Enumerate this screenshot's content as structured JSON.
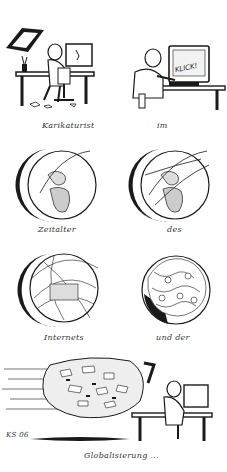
{
  "cartoon": {
    "language": "de",
    "panels": [
      {
        "id": "p1",
        "scene": "cartoonist-drawing-at-desk",
        "caption": "Karikaturist"
      },
      {
        "id": "p2",
        "scene": "cartoonist-clicking-computer",
        "screen_text": "KLICK!",
        "caption": "im"
      },
      {
        "id": "p3",
        "scene": "globe-few-connections",
        "caption": "Zeitalter"
      },
      {
        "id": "p4",
        "scene": "globe-more-connections",
        "caption": "des"
      },
      {
        "id": "p5",
        "scene": "globe-dense-connections",
        "caption": "Internets"
      },
      {
        "id": "p6",
        "scene": "globe-covered-in-paper",
        "caption": "und der"
      },
      {
        "id": "p7",
        "scene": "paper-flood-hits-cartoonist",
        "caption": "Globalisierung ..."
      }
    ],
    "signature": "KS 06",
    "colors": {
      "ink": "#1a1a1a",
      "paper": "#ffffff",
      "shade": "#555555"
    }
  }
}
